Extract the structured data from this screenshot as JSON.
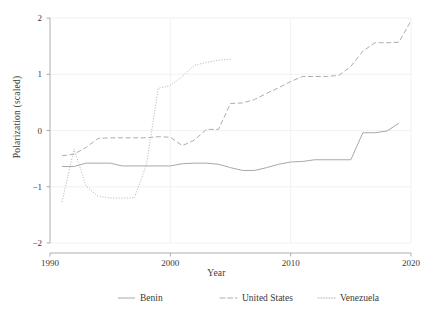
{
  "chart_data": {
    "type": "line",
    "title": "",
    "xlabel": "Year",
    "ylabel": "Polarization (scaled)",
    "xlim": [
      1990,
      2020
    ],
    "ylim": [
      -2,
      2
    ],
    "xticks": [
      1990,
      2000,
      2010,
      2020
    ],
    "yticks": [
      -2,
      -1,
      0,
      1,
      2
    ],
    "xtick_labels": [
      "1990",
      "2000",
      "2010",
      "2020"
    ],
    "ytick_labels": [
      "−2",
      "−1",
      "0",
      "1",
      "2"
    ],
    "grid": true,
    "legend_position": "bottom",
    "series": [
      {
        "name": "Benin",
        "style": "solid",
        "color": "#a8a8a8",
        "x": [
          1991,
          1992,
          1993,
          1994,
          1995,
          1996,
          1997,
          1998,
          1999,
          2000,
          2001,
          2002,
          2003,
          2004,
          2005,
          2006,
          2007,
          2008,
          2009,
          2010,
          2011,
          2012,
          2013,
          2014,
          2015,
          2016,
          2017,
          2018,
          2019
        ],
        "values": [
          -0.64,
          -0.64,
          -0.58,
          -0.58,
          -0.58,
          -0.63,
          -0.63,
          -0.63,
          -0.63,
          -0.63,
          -0.59,
          -0.58,
          -0.58,
          -0.6,
          -0.66,
          -0.71,
          -0.71,
          -0.66,
          -0.6,
          -0.56,
          -0.55,
          -0.52,
          -0.52,
          -0.52,
          -0.52,
          -0.04,
          -0.04,
          -0.01,
          0.13
        ]
      },
      {
        "name": "United States",
        "style": "dashed",
        "color": "#adadad",
        "x": [
          1991,
          1992,
          1993,
          1994,
          1995,
          1996,
          1997,
          1998,
          1999,
          2000,
          2001,
          2002,
          2003,
          2004,
          2005,
          2006,
          2007,
          2008,
          2009,
          2010,
          2011,
          2012,
          2013,
          2014,
          2015,
          2016,
          2017,
          2018,
          2019,
          2020
        ],
        "values": [
          -0.45,
          -0.42,
          -0.3,
          -0.14,
          -0.13,
          -0.13,
          -0.13,
          -0.13,
          -0.11,
          -0.12,
          -0.27,
          -0.17,
          0.02,
          0.02,
          0.48,
          0.49,
          0.55,
          0.66,
          0.76,
          0.87,
          0.96,
          0.96,
          0.96,
          0.98,
          1.14,
          1.41,
          1.56,
          1.56,
          1.57,
          1.95
        ]
      },
      {
        "name": "Venezuela",
        "style": "dotted",
        "color": "#b2b2b2",
        "x": [
          1991,
          1992,
          1993,
          1994,
          1995,
          1996,
          1997,
          1998,
          1999,
          2000,
          2001,
          2002,
          2003,
          2004,
          2005
        ],
        "values": [
          -1.27,
          -0.33,
          -0.99,
          -1.17,
          -1.2,
          -1.2,
          -1.2,
          -0.62,
          0.75,
          0.8,
          0.96,
          1.16,
          1.21,
          1.25,
          1.27
        ]
      }
    ]
  },
  "legend": {
    "items": [
      {
        "label": "Benin"
      },
      {
        "label": "United States"
      },
      {
        "label": "Venezuela"
      }
    ]
  }
}
